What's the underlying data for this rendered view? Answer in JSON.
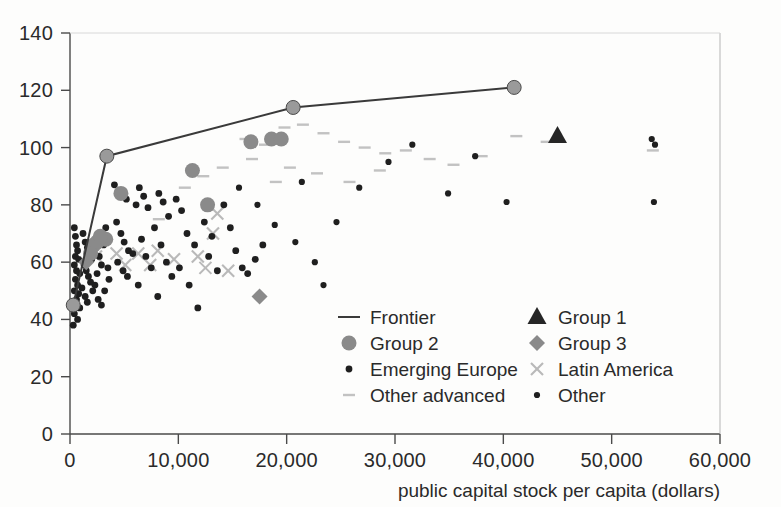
{
  "chart_data": {
    "type": "scatter",
    "title": "",
    "xlabel": "public capital stock per capita (dollars)",
    "ylabel": "",
    "xlim": [
      0,
      60000
    ],
    "ylim": [
      0,
      140
    ],
    "xticks": [
      0,
      10000,
      20000,
      30000,
      40000,
      50000,
      60000
    ],
    "xtick_labels": [
      "0",
      "10,000",
      "20,000",
      "30,000",
      "40,000",
      "50,000",
      "60,000"
    ],
    "yticks": [
      0,
      20,
      40,
      60,
      80,
      100,
      120,
      140
    ],
    "ytick_labels": [
      "0",
      "20",
      "40",
      "60",
      "80",
      "100",
      "120",
      "140"
    ],
    "grid": false,
    "legend_position": "inside-lower-right",
    "legend": [
      {
        "label": "Frontier",
        "marker": "line",
        "color": "#3a3a3a"
      },
      {
        "label": "Group 1",
        "marker": "triangle",
        "color": "#262626"
      },
      {
        "label": "Group 2",
        "marker": "circle-large",
        "color": "#8a8a8a"
      },
      {
        "label": "Group 3",
        "marker": "diamond",
        "color": "#8a8a8a"
      },
      {
        "label": "Emerging Europe",
        "marker": "circle-small",
        "color": "#1f1f1f"
      },
      {
        "label": "Latin America",
        "marker": "cross",
        "color": "#b9b9b9"
      },
      {
        "label": "Other advanced",
        "marker": "dash",
        "color": "#c2c2c2"
      },
      {
        "label": "Other",
        "marker": "dot-tiny",
        "color": "#1f1f1f"
      }
    ],
    "series": [
      {
        "name": "Frontier",
        "type": "line",
        "color": "#3a3a3a",
        "points": [
          [
            300,
            45
          ],
          [
            3400,
            97
          ],
          [
            20600,
            114
          ],
          [
            41000,
            121
          ]
        ]
      },
      {
        "name": "Frontier nodes",
        "type": "scatter",
        "marker": "circle-large",
        "color": "#9a9a9a",
        "points": [
          [
            300,
            45
          ],
          [
            3400,
            97
          ],
          [
            20600,
            114
          ],
          [
            41000,
            121
          ]
        ]
      },
      {
        "name": "Group 1",
        "type": "scatter",
        "marker": "triangle",
        "color": "#262626",
        "points": [
          [
            45000,
            104
          ]
        ]
      },
      {
        "name": "Group 2",
        "type": "scatter",
        "marker": "circle-large",
        "color": "#8a8a8a",
        "points": [
          [
            11300,
            92
          ],
          [
            12700,
            80
          ],
          [
            16700,
            102
          ],
          [
            18600,
            103
          ],
          [
            19500,
            103
          ],
          [
            4700,
            84
          ],
          [
            3300,
            68
          ],
          [
            2500,
            67
          ],
          [
            2200,
            66
          ],
          [
            1900,
            63
          ],
          [
            2800,
            69
          ]
        ]
      },
      {
        "name": "Group 3",
        "type": "scatter",
        "marker": "diamond",
        "color": "#8a8a8a",
        "points": [
          [
            17500,
            48
          ],
          [
            1500,
            60
          ]
        ]
      },
      {
        "name": "Emerging Europe",
        "type": "scatter",
        "marker": "circle-small",
        "color": "#1f1f1f",
        "points": [
          [
            400,
            72
          ],
          [
            500,
            69
          ],
          [
            600,
            66
          ],
          [
            700,
            64
          ],
          [
            500,
            62
          ],
          [
            800,
            61
          ],
          [
            400,
            59
          ],
          [
            600,
            57
          ],
          [
            900,
            56
          ],
          [
            500,
            54
          ],
          [
            700,
            52
          ],
          [
            400,
            50
          ],
          [
            800,
            49
          ],
          [
            600,
            47
          ],
          [
            500,
            45
          ],
          [
            900,
            44
          ],
          [
            400,
            42
          ],
          [
            700,
            40
          ],
          [
            300,
            38
          ],
          [
            1200,
            70
          ],
          [
            1400,
            67
          ],
          [
            1600,
            65
          ],
          [
            1800,
            63
          ],
          [
            2000,
            61
          ],
          [
            1300,
            59
          ],
          [
            1500,
            57
          ],
          [
            1700,
            55
          ],
          [
            1900,
            53
          ],
          [
            1100,
            51
          ],
          [
            2100,
            50
          ],
          [
            1400,
            48
          ],
          [
            1600,
            46
          ],
          [
            2300,
            52
          ],
          [
            2500,
            56
          ],
          [
            2700,
            62
          ],
          [
            2900,
            59
          ],
          [
            3100,
            66
          ],
          [
            3300,
            72
          ],
          [
            3500,
            58
          ],
          [
            2600,
            47
          ],
          [
            2900,
            45
          ],
          [
            3200,
            50
          ],
          [
            3600,
            54
          ],
          [
            4100,
            87
          ],
          [
            4500,
            85
          ],
          [
            4800,
            84
          ],
          [
            5200,
            82
          ],
          [
            4300,
            74
          ],
          [
            4700,
            70
          ],
          [
            5000,
            67
          ],
          [
            5400,
            64
          ],
          [
            4400,
            60
          ],
          [
            4900,
            57
          ],
          [
            5300,
            55
          ],
          [
            5800,
            63
          ],
          [
            6100,
            80
          ],
          [
            6400,
            86
          ],
          [
            6800,
            83
          ],
          [
            7200,
            79
          ],
          [
            6600,
            68
          ],
          [
            7000,
            62
          ],
          [
            7500,
            58
          ],
          [
            6300,
            52
          ],
          [
            7800,
            72
          ],
          [
            8200,
            84
          ],
          [
            8600,
            81
          ],
          [
            9100,
            76
          ],
          [
            8400,
            66
          ],
          [
            8900,
            60
          ],
          [
            9400,
            55
          ],
          [
            8100,
            48
          ],
          [
            9800,
            82
          ],
          [
            10300,
            78
          ],
          [
            10800,
            70
          ],
          [
            11500,
            66
          ],
          [
            10100,
            58
          ],
          [
            11000,
            52
          ],
          [
            11800,
            44
          ],
          [
            12400,
            74
          ],
          [
            13100,
            69
          ],
          [
            12800,
            62
          ],
          [
            13600,
            57
          ],
          [
            14200,
            80
          ],
          [
            14800,
            72
          ],
          [
            15300,
            64
          ],
          [
            15900,
            58
          ],
          [
            16400,
            56
          ],
          [
            17100,
            61
          ],
          [
            17800,
            66
          ]
        ]
      },
      {
        "name": "Latin America",
        "type": "scatter",
        "marker": "cross",
        "color": "#b9b9b9",
        "points": [
          [
            2400,
            62
          ],
          [
            4300,
            63
          ],
          [
            6300,
            63
          ],
          [
            8100,
            64
          ],
          [
            9600,
            61
          ],
          [
            11800,
            62
          ],
          [
            13600,
            77
          ],
          [
            13200,
            70
          ],
          [
            5100,
            59
          ],
          [
            7400,
            59
          ],
          [
            12500,
            58
          ],
          [
            14600,
            57
          ]
        ]
      },
      {
        "name": "Other advanced",
        "type": "scatter",
        "marker": "dash",
        "color": "#c2c2c2",
        "points": [
          [
            8200,
            75
          ],
          [
            10600,
            86
          ],
          [
            12300,
            90
          ],
          [
            14100,
            93
          ],
          [
            16200,
            103
          ],
          [
            18000,
            101
          ],
          [
            19800,
            107
          ],
          [
            21500,
            108
          ],
          [
            23400,
            105
          ],
          [
            25300,
            102
          ],
          [
            27200,
            100
          ],
          [
            29100,
            98
          ],
          [
            31000,
            99
          ],
          [
            33200,
            96
          ],
          [
            35400,
            94
          ],
          [
            38000,
            97
          ],
          [
            41200,
            104
          ],
          [
            44000,
            102
          ],
          [
            20300,
            93
          ],
          [
            22800,
            91
          ],
          [
            25800,
            88
          ],
          [
            28600,
            92
          ],
          [
            16800,
            96
          ],
          [
            19000,
            88
          ],
          [
            53800,
            99
          ]
        ]
      },
      {
        "name": "Other",
        "type": "scatter",
        "marker": "dot-tiny",
        "color": "#1f1f1f",
        "points": [
          [
            21400,
            88
          ],
          [
            23400,
            52
          ],
          [
            26700,
            86
          ],
          [
            29400,
            95
          ],
          [
            31600,
            101
          ],
          [
            34900,
            84
          ],
          [
            37400,
            97
          ],
          [
            40300,
            81
          ],
          [
            53700,
            103
          ],
          [
            54000,
            101
          ],
          [
            53900,
            81
          ],
          [
            18900,
            73
          ],
          [
            20800,
            67
          ],
          [
            22600,
            60
          ],
          [
            17300,
            80
          ],
          [
            15600,
            86
          ],
          [
            24600,
            74
          ]
        ]
      }
    ]
  }
}
